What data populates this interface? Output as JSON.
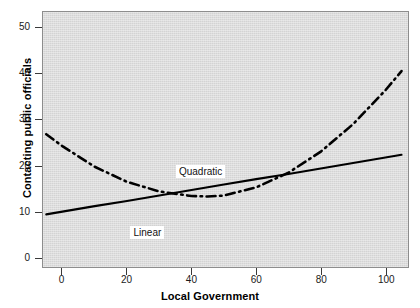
{
  "chart_data": {
    "type": "line",
    "title": "",
    "xlabel": "Local Government",
    "ylabel": "Contacting public officials",
    "xlim": [
      -6,
      107
    ],
    "ylim": [
      -2.2,
      53.5
    ],
    "xticks": [
      0,
      20,
      40,
      60,
      80,
      100
    ],
    "yticks": [
      0,
      10,
      20,
      30,
      40,
      50
    ],
    "xtick_labels": [
      "0",
      "20",
      "40",
      "60",
      "80",
      "100"
    ],
    "ytick_labels": [
      "0",
      "10",
      "20",
      "30",
      "40",
      "50"
    ],
    "grid": false,
    "legend": "inline-annotations",
    "plot_background": "#dcdcdc",
    "series": [
      {
        "name": "Linear",
        "style": "solid",
        "color": "#000000",
        "annotation": "Linear",
        "x": [
          -5,
          0,
          10,
          20,
          30,
          40,
          50,
          60,
          70,
          80,
          90,
          100,
          105
        ],
        "values": [
          9.3,
          9.9,
          11.1,
          12.2,
          13.4,
          14.6,
          15.8,
          17.0,
          18.1,
          19.3,
          20.5,
          21.7,
          22.3
        ]
      },
      {
        "name": "Quadratic",
        "style": "dash-dot",
        "color": "#000000",
        "annotation": "Quadratic",
        "x": [
          -5,
          0,
          10,
          20,
          30,
          40,
          45,
          50,
          60,
          70,
          80,
          90,
          100,
          105
        ],
        "values": [
          26.8,
          24.2,
          19.7,
          16.4,
          14.3,
          13.3,
          13.2,
          13.4,
          15.2,
          18.4,
          23.0,
          29.0,
          36.4,
          40.6
        ]
      }
    ],
    "annotations": [
      {
        "text": "Quadratic",
        "x": 22,
        "y": 21.5
      },
      {
        "text": "Linear",
        "x": 8,
        "y": 8.2
      }
    ]
  },
  "axes": {
    "y_title": "Contacting public officials",
    "x_title": "Local Government"
  }
}
